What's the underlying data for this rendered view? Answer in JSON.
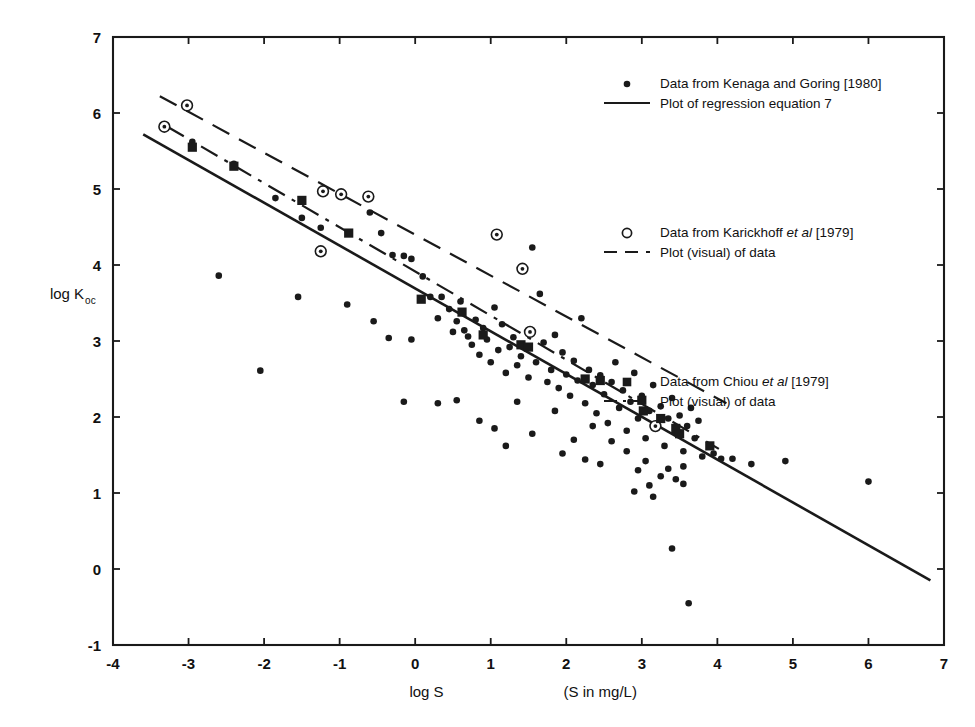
{
  "chart_data": {
    "type": "scatter",
    "title": "",
    "xlabel": "log S",
    "xlabel_note": "(S in mg/L)",
    "ylabel": "log Koc",
    "ylabel_main": "log K",
    "ylabel_sub": "oc",
    "xlim": [
      -4,
      7
    ],
    "ylim": [
      -1,
      7
    ],
    "xticks": [
      "-4",
      "-3",
      "-2",
      "-1",
      "0",
      "1",
      "2",
      "3",
      "4",
      "5",
      "6",
      "7"
    ],
    "xtick_values": [
      -4,
      -3,
      -2,
      -1,
      0,
      1,
      2,
      3,
      4,
      5,
      6,
      7
    ],
    "yticks": [
      "-1",
      "0",
      "1",
      "2",
      "3",
      "4",
      "5",
      "6",
      "7"
    ],
    "ytick_values": [
      -1,
      0,
      1,
      2,
      3,
      4,
      5,
      6,
      7
    ],
    "grid": false,
    "legend_position": "upper-right-inside",
    "series": [
      {
        "name": "Data from Kenaga and Goring [1980]",
        "marker": "filled-circle",
        "points": [
          [
            -2.95,
            5.62
          ],
          [
            -2.4,
            5.33
          ],
          [
            -1.85,
            4.88
          ],
          [
            -1.5,
            4.62
          ],
          [
            -1.25,
            4.49
          ],
          [
            -0.95,
            4.93
          ],
          [
            -0.6,
            4.69
          ],
          [
            -0.45,
            4.42
          ],
          [
            -0.3,
            4.13
          ],
          [
            -0.15,
            4.12
          ],
          [
            -0.05,
            4.08
          ],
          [
            -2.6,
            3.86
          ],
          [
            -2.05,
            2.61
          ],
          [
            -1.55,
            3.58
          ],
          [
            -0.9,
            3.48
          ],
          [
            -0.55,
            3.26
          ],
          [
            -0.35,
            3.04
          ],
          [
            -0.15,
            2.2
          ],
          [
            -0.05,
            3.02
          ],
          [
            0.1,
            3.85
          ],
          [
            0.2,
            3.58
          ],
          [
            0.3,
            3.3
          ],
          [
            0.35,
            3.58
          ],
          [
            0.45,
            3.42
          ],
          [
            0.5,
            3.12
          ],
          [
            0.55,
            3.26
          ],
          [
            0.6,
            3.52
          ],
          [
            0.65,
            3.14
          ],
          [
            0.7,
            3.06
          ],
          [
            0.75,
            2.95
          ],
          [
            0.8,
            3.28
          ],
          [
            0.85,
            2.82
          ],
          [
            0.9,
            3.17
          ],
          [
            0.95,
            3.02
          ],
          [
            1.0,
            2.72
          ],
          [
            1.05,
            3.44
          ],
          [
            1.1,
            2.88
          ],
          [
            1.15,
            3.22
          ],
          [
            1.2,
            2.58
          ],
          [
            1.25,
            2.92
          ],
          [
            1.3,
            3.05
          ],
          [
            1.35,
            2.68
          ],
          [
            1.4,
            2.8
          ],
          [
            1.45,
            3.95
          ],
          [
            1.5,
            2.52
          ],
          [
            1.55,
            4.23
          ],
          [
            1.6,
            2.72
          ],
          [
            1.65,
            3.62
          ],
          [
            1.7,
            2.98
          ],
          [
            1.75,
            2.46
          ],
          [
            1.8,
            2.62
          ],
          [
            1.85,
            3.08
          ],
          [
            1.9,
            2.38
          ],
          [
            1.95,
            2.85
          ],
          [
            2.0,
            2.56
          ],
          [
            2.05,
            2.28
          ],
          [
            2.1,
            2.74
          ],
          [
            2.15,
            2.48
          ],
          [
            2.2,
            3.3
          ],
          [
            2.25,
            2.18
          ],
          [
            2.3,
            2.62
          ],
          [
            2.35,
            2.42
          ],
          [
            2.4,
            2.05
          ],
          [
            2.45,
            2.55
          ],
          [
            2.5,
            2.3
          ],
          [
            2.55,
            1.92
          ],
          [
            2.6,
            2.46
          ],
          [
            2.65,
            2.72
          ],
          [
            2.7,
            2.12
          ],
          [
            2.75,
            2.35
          ],
          [
            2.8,
            1.82
          ],
          [
            2.85,
            2.2
          ],
          [
            2.9,
            2.58
          ],
          [
            2.95,
            1.98
          ],
          [
            3.0,
            2.28
          ],
          [
            3.05,
            1.72
          ],
          [
            3.1,
            2.08
          ],
          [
            3.15,
            2.42
          ],
          [
            3.2,
            1.9
          ],
          [
            3.25,
            2.14
          ],
          [
            3.3,
            1.62
          ],
          [
            3.35,
            1.98
          ],
          [
            3.4,
            2.25
          ],
          [
            3.45,
            1.8
          ],
          [
            3.5,
            2.02
          ],
          [
            3.55,
            1.55
          ],
          [
            3.6,
            1.88
          ],
          [
            3.65,
            2.12
          ],
          [
            3.7,
            1.72
          ],
          [
            3.75,
            1.95
          ],
          [
            3.8,
            1.48
          ],
          [
            0.55,
            2.22
          ],
          [
            0.3,
            2.18
          ],
          [
            0.85,
            1.95
          ],
          [
            1.35,
            2.2
          ],
          [
            1.05,
            1.85
          ],
          [
            1.55,
            1.78
          ],
          [
            1.2,
            1.62
          ],
          [
            1.85,
            2.08
          ],
          [
            2.1,
            1.7
          ],
          [
            1.95,
            1.52
          ],
          [
            2.35,
            1.88
          ],
          [
            2.25,
            1.44
          ],
          [
            2.6,
            1.68
          ],
          [
            2.45,
            1.38
          ],
          [
            2.8,
            1.55
          ],
          [
            2.95,
            1.3
          ],
          [
            3.05,
            1.42
          ],
          [
            3.25,
            1.22
          ],
          [
            3.1,
            1.1
          ],
          [
            3.35,
            1.32
          ],
          [
            3.45,
            1.18
          ],
          [
            3.55,
            1.35
          ],
          [
            2.9,
            1.02
          ],
          [
            3.15,
            0.95
          ],
          [
            3.4,
            0.27
          ],
          [
            3.62,
            -0.45
          ],
          [
            3.55,
            1.12
          ],
          [
            4.2,
            1.45
          ],
          [
            4.45,
            1.38
          ],
          [
            4.9,
            1.42
          ],
          [
            6.0,
            1.15
          ],
          [
            3.95,
            1.52
          ],
          [
            4.05,
            1.45
          ]
        ]
      },
      {
        "name": "Data from Karickhoff et al [1979]",
        "marker": "open-circle",
        "points": [
          [
            -3.32,
            5.82
          ],
          [
            -3.02,
            6.1
          ],
          [
            -1.22,
            4.97
          ],
          [
            -0.98,
            4.93
          ],
          [
            -0.62,
            4.9
          ],
          [
            -1.25,
            4.18
          ],
          [
            1.08,
            4.4
          ],
          [
            1.42,
            3.95
          ],
          [
            1.52,
            3.12
          ],
          [
            3.18,
            1.88
          ]
        ]
      },
      {
        "name": "Data from Chiou et al [1979]",
        "marker": "filled-square",
        "points": [
          [
            -2.95,
            5.55
          ],
          [
            -2.4,
            5.3
          ],
          [
            -1.5,
            4.85
          ],
          [
            -0.88,
            4.42
          ],
          [
            0.08,
            3.55
          ],
          [
            0.62,
            3.38
          ],
          [
            0.9,
            3.08
          ],
          [
            1.4,
            2.95
          ],
          [
            1.5,
            2.92
          ],
          [
            2.25,
            2.5
          ],
          [
            2.45,
            2.48
          ],
          [
            3.0,
            2.22
          ],
          [
            3.02,
            2.08
          ],
          [
            3.25,
            1.98
          ],
          [
            3.45,
            1.85
          ],
          [
            3.5,
            1.78
          ],
          [
            3.9,
            1.62
          ]
        ]
      }
    ],
    "lines": [
      {
        "name": "Plot of regression equation 7",
        "style": "solid",
        "points": [
          [
            -3.6,
            5.72
          ],
          [
            6.82,
            -0.15
          ]
        ]
      },
      {
        "name": "Plot (visual) of data — Karickhoff",
        "style": "dashed",
        "points": [
          [
            -3.38,
            6.22
          ],
          [
            4.12,
            2.18
          ]
        ]
      },
      {
        "name": "Plot (visual) of data — Chiou",
        "style": "dash-dot",
        "points": [
          [
            -3.28,
            5.82
          ],
          [
            4.02,
            1.58
          ]
        ]
      }
    ],
    "legend": [
      {
        "marker": "filled-circle",
        "data_label_pre": "Data from Kenaga and Goring [1980]",
        "line_style": "solid",
        "line_label": "Plot of regression equation 7"
      },
      {
        "marker": "open-circle",
        "data_label_pre": "Data from Karickhoff ",
        "data_label_italic": "et al",
        "data_label_post": " [1979]",
        "line_style": "dashed",
        "line_label": "Plot (visual) of data"
      },
      {
        "marker": "filled-square",
        "data_label_pre": "Data from Chiou ",
        "data_label_italic": "et al",
        "data_label_post": " [1979]",
        "line_style": "dash-dot",
        "line_label": "Plot (visual) of data"
      }
    ],
    "colors": {
      "ink": "#1a1a1a",
      "background": "#ffffff"
    }
  }
}
